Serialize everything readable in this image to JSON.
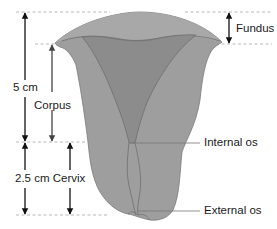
{
  "diagram": {
    "labels": {
      "fundus": "Fundus",
      "corpus": "Corpus",
      "length_total": "5 cm",
      "cervix": "2.5 cm Cervix",
      "internal_os": "Internal os",
      "external_os": "External os"
    },
    "colors": {
      "uterus_outer": "#9c9c9c",
      "uterus_inner": "#8a8a8a",
      "outline": "#6e6e6e",
      "arrow": "#111111",
      "dashed": "#b8b8b8",
      "leader": "#777777"
    }
  }
}
